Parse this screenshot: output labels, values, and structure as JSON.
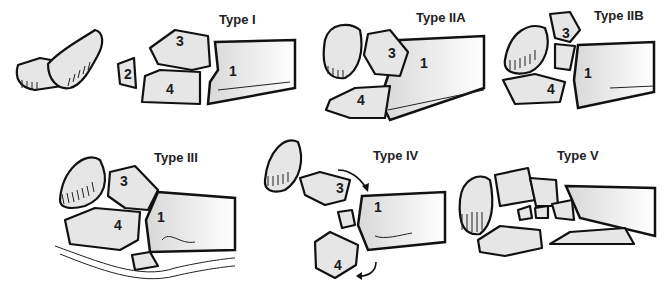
{
  "figure": {
    "panels": [
      {
        "id": "type-i",
        "title": "Type I",
        "labels": [
          "1",
          "2",
          "3",
          "4"
        ]
      },
      {
        "id": "type-iia",
        "title": "Type IIA",
        "labels": [
          "1",
          "3",
          "4"
        ]
      },
      {
        "id": "type-iib",
        "title": "Type IIB",
        "labels": [
          "1",
          "3",
          "4"
        ]
      },
      {
        "id": "type-iii",
        "title": "Type III",
        "labels": [
          "1",
          "3",
          "4"
        ]
      },
      {
        "id": "type-iv",
        "title": "Type IV",
        "labels": [
          "1",
          "3",
          "4"
        ]
      },
      {
        "id": "type-v",
        "title": "Type V",
        "labels": []
      }
    ]
  },
  "colors": {
    "bone_fill": "#e6e6e6",
    "outline": "#111111",
    "background": "#ffffff"
  }
}
